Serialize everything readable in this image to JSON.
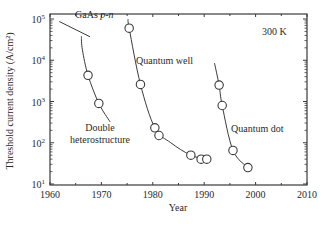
{
  "chart_data": {
    "type": "scatter",
    "title": "",
    "xlabel": "Year",
    "ylabel": "Threshold current density (A/cm²)",
    "xlim": [
      1960,
      2010
    ],
    "ylim": [
      10,
      100000
    ],
    "yscale": "log",
    "grid": false,
    "x_ticks": [
      1960,
      1970,
      1980,
      1990,
      2000,
      2010
    ],
    "y_ticks": [
      {
        "value": 10,
        "label_base": "10",
        "label_exp": "1"
      },
      {
        "value": 100,
        "label_base": "10",
        "label_exp": "2"
      },
      {
        "value": 1000,
        "label_base": "10",
        "label_exp": "3"
      },
      {
        "value": 10000,
        "label_base": "10",
        "label_exp": "4"
      },
      {
        "value": 100000,
        "label_base": "10",
        "label_exp": "5"
      }
    ],
    "annotations": [
      {
        "text_main": "GaAs ",
        "text_italic": "p-n",
        "note": "homojunction reference line"
      },
      {
        "text": "300 K"
      },
      {
        "text": "Double heterostructure"
      },
      {
        "text": "Quantum well"
      },
      {
        "text": "Quantum dot"
      }
    ],
    "series": [
      {
        "name": "GaAs p-n",
        "marker": "none",
        "line": [
          [
            1961.8,
            87000
          ],
          [
            1967.8,
            37000
          ]
        ],
        "points": []
      },
      {
        "name": "Double heterostructure",
        "marker": "open-circle",
        "line": [
          [
            1966.1,
            38000
          ],
          [
            1966.3,
            18000
          ],
          [
            1967.4,
            4300
          ],
          [
            1969.5,
            900
          ],
          [
            1971.7,
            320
          ]
        ],
        "points": [
          [
            1967.4,
            4300
          ],
          [
            1969.5,
            900
          ]
        ]
      },
      {
        "name": "Quantum well",
        "marker": "open-circle",
        "line": [
          [
            1975.2,
            100000
          ],
          [
            1975.4,
            60000
          ],
          [
            1977.6,
            2600
          ],
          [
            1980.4,
            230
          ],
          [
            1983.5,
            100
          ],
          [
            1987.4,
            50
          ],
          [
            1991,
            38
          ]
        ],
        "points": [
          [
            1975.4,
            60000
          ],
          [
            1977.6,
            2600
          ],
          [
            1980.4,
            230
          ],
          [
            1981.2,
            150
          ],
          [
            1987.4,
            50
          ],
          [
            1989.4,
            40
          ],
          [
            1990.5,
            40
          ]
        ]
      },
      {
        "name": "Quantum dot",
        "marker": "open-circle",
        "line": [
          [
            1992.0,
            8500
          ],
          [
            1992.9,
            2500
          ],
          [
            1993.5,
            800
          ],
          [
            1995.6,
            65
          ],
          [
            1998.5,
            25
          ]
        ],
        "points": [
          [
            1992.9,
            2500
          ],
          [
            1993.5,
            800
          ],
          [
            1995.6,
            65
          ],
          [
            1998.5,
            25
          ]
        ]
      }
    ]
  },
  "labels": {
    "xlabel": "Year",
    "ylabel": "Threshold current density (A/cm²)",
    "temperature": "300 K",
    "gaas": "GaAs ",
    "gaas_italic": "p-n",
    "dh_line1": "Double",
    "dh_line2": "heterostructure",
    "qw": "Quantum well",
    "qd": "Quantum dot"
  }
}
